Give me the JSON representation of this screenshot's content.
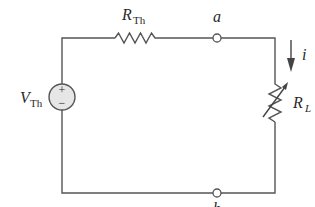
{
  "diagram": {
    "type": "circuit",
    "colors": {
      "wire": "#555555",
      "source_fill": "#e6e6e6",
      "text": "#2a2a2a"
    },
    "source": {
      "label_main": "V",
      "label_sub": "Th",
      "plus": "+",
      "minus": "−"
    },
    "thevenin_resistor": {
      "label_main": "R",
      "label_sub": "Th"
    },
    "node_a": {
      "label": "a"
    },
    "node_b": {
      "label": "b"
    },
    "current": {
      "label": "i"
    },
    "load_resistor": {
      "label_main": "R",
      "label_sub": "L"
    }
  }
}
